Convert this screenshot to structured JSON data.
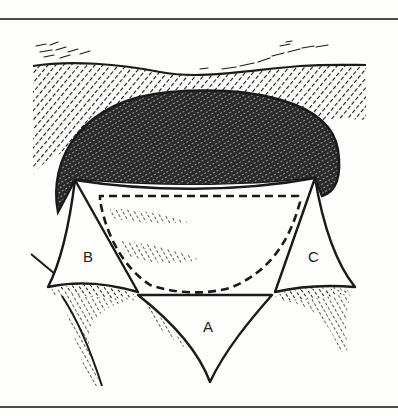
{
  "figure": {
    "type": "surgical-flap-illustration",
    "labels": {
      "a": "A",
      "b": "B",
      "c": "C"
    },
    "colors": {
      "ink": "#1a1a1a",
      "paper": "#fdfdfb",
      "rule": "#4a4a4a"
    }
  }
}
